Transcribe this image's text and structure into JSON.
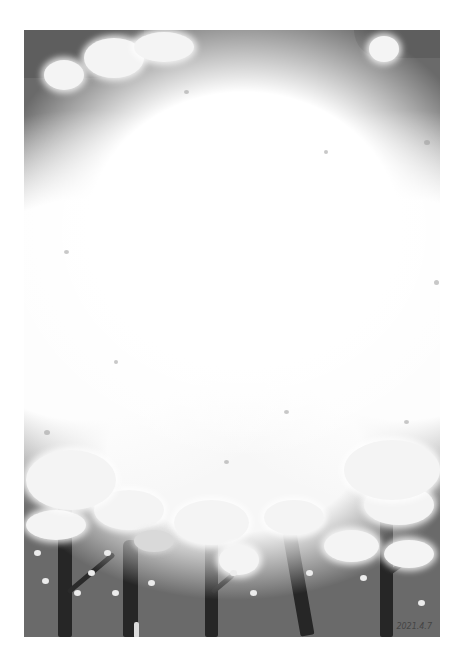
{
  "artwork": {
    "subject": "painting of white blossoming trees against a gray sky",
    "palette": {
      "background_margin": "#ffffff",
      "sky": "#6a6a6a",
      "sky_dark_corner": "#5e5e5e",
      "blossom": "#f4f4f4",
      "trunk": "#262626"
    },
    "trunk_count": 5,
    "signature": "2021.4.7"
  }
}
